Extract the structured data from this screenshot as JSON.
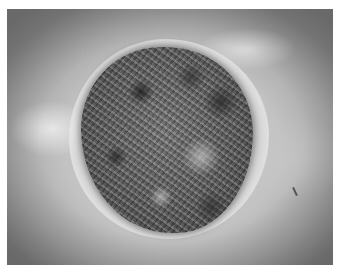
{
  "image": {
    "description": "Grayscale clinical photograph of a large crusted, irregular round lesion on skin",
    "colors": {
      "background": "#ffffff",
      "skin_light": "#d4d4d4",
      "skin_dark": "#8c8c8c",
      "lesion_dark": "#4a4a4a",
      "lesion_light": "#bebebe"
    }
  }
}
